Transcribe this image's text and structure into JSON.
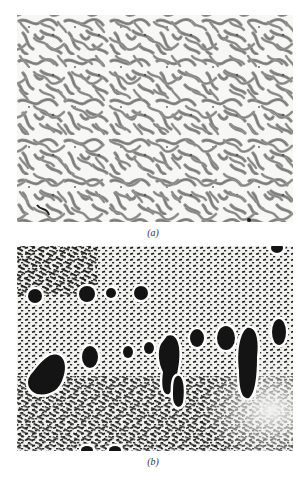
{
  "figure": {
    "panels": [
      {
        "id": "a",
        "label": "(a)",
        "description": "Micrograph showing interconnected gray network (dendritic/eutectic-like structure) on white background"
      },
      {
        "id": "b",
        "label": "(b)",
        "description": "Micrograph showing fine black lamellar/rod eutectic with large black primary particles surrounded by white halos"
      }
    ],
    "caption_partial": "",
    "colors": {
      "background": "#ffffff",
      "panel_a_network": "#8a8a86",
      "panel_a_outline": "#555555",
      "panel_b_particles": "#161616",
      "panel_b_matrix": "#f2f2f0"
    }
  }
}
